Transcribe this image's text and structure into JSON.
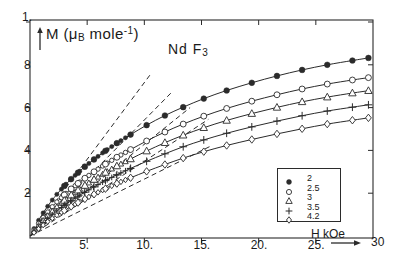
{
  "chart_data": {
    "type": "line",
    "title": "Nd F3",
    "title_display": "Nd F",
    "title_sub": "3",
    "xlabel": "H kOe",
    "ylabel": "M (μ_B mole^-1)",
    "ylabel_main": "M (",
    "ylabel_sub": "B",
    "ylabel_mid": " mole",
    "ylabel_sup": "-1",
    "ylabel_end": ")",
    "ylabel_mu": "μ",
    "xlim": [
      0,
      30
    ],
    "ylim": [
      0,
      1.0
    ],
    "xticks": [
      "5.",
      "10.",
      "15.",
      "20.",
      "25.",
      "30"
    ],
    "xtick_values": [
      5,
      10,
      15,
      20,
      25,
      30
    ],
    "yticks": [
      "1.",
      "8",
      "6",
      "4",
      "2"
    ],
    "ytick_values": [
      1.0,
      0.8,
      0.6,
      0.4,
      0.2
    ],
    "grid": false,
    "legend_position": "lower-right",
    "legend_title": "",
    "series": [
      {
        "name": "2",
        "label": "2",
        "marker": "filled-circle",
        "x": [
          0.6,
          1.2,
          1.8,
          2.4,
          3.0,
          3.6,
          4.2,
          4.8,
          5.6,
          6.6,
          7.6,
          8.8,
          10.2,
          11.8,
          13.4,
          15.2,
          17.2,
          19.4,
          21.6,
          23.8,
          26.0,
          28.2,
          29.6
        ],
        "y": [
          0.06,
          0.112,
          0.158,
          0.198,
          0.234,
          0.266,
          0.296,
          0.324,
          0.358,
          0.398,
          0.434,
          0.474,
          0.518,
          0.563,
          0.602,
          0.642,
          0.68,
          0.716,
          0.748,
          0.776,
          0.8,
          0.82,
          0.832
        ]
      },
      {
        "name": "2.5",
        "label": "2.5",
        "marker": "open-circle",
        "x": [
          0.6,
          1.2,
          1.8,
          2.4,
          3.0,
          3.6,
          4.2,
          4.8,
          5.6,
          6.6,
          7.6,
          8.8,
          10.2,
          11.8,
          13.4,
          15.2,
          17.2,
          19.4,
          21.6,
          23.8,
          26.0,
          28.2,
          29.6
        ],
        "y": [
          0.048,
          0.09,
          0.128,
          0.162,
          0.192,
          0.22,
          0.246,
          0.27,
          0.3,
          0.336,
          0.368,
          0.404,
          0.444,
          0.486,
          0.523,
          0.56,
          0.596,
          0.63,
          0.66,
          0.687,
          0.71,
          0.729,
          0.74
        ]
      },
      {
        "name": "3",
        "label": "3",
        "marker": "triangle",
        "x": [
          0.6,
          1.2,
          1.8,
          2.4,
          3.0,
          3.6,
          4.2,
          4.8,
          5.6,
          6.6,
          7.6,
          8.8,
          10.2,
          11.8,
          13.4,
          15.2,
          17.2,
          19.4,
          21.6,
          23.8,
          26.0,
          28.2,
          29.6
        ],
        "y": [
          0.04,
          0.076,
          0.109,
          0.139,
          0.166,
          0.191,
          0.214,
          0.236,
          0.264,
          0.297,
          0.327,
          0.36,
          0.397,
          0.436,
          0.471,
          0.506,
          0.54,
          0.572,
          0.601,
          0.627,
          0.649,
          0.668,
          0.679
        ]
      },
      {
        "name": "3.5",
        "label": "3.5",
        "marker": "plus",
        "x": [
          0.6,
          1.2,
          1.8,
          2.4,
          3.0,
          3.6,
          4.2,
          4.8,
          5.6,
          6.6,
          7.6,
          8.8,
          10.2,
          11.8,
          13.4,
          15.2,
          17.2,
          19.4,
          21.6,
          23.8,
          26.0,
          28.2,
          29.6
        ],
        "y": [
          0.034,
          0.065,
          0.093,
          0.119,
          0.143,
          0.165,
          0.186,
          0.205,
          0.23,
          0.259,
          0.286,
          0.316,
          0.349,
          0.384,
          0.417,
          0.449,
          0.48,
          0.51,
          0.537,
          0.562,
          0.584,
          0.602,
          0.613
        ]
      },
      {
        "name": "4.2",
        "label": "4.2",
        "marker": "diamond",
        "x": [
          0.6,
          1.2,
          1.8,
          2.4,
          3.0,
          3.6,
          4.2,
          4.8,
          5.6,
          6.6,
          7.6,
          8.8,
          10.2,
          11.8,
          13.4,
          15.2,
          17.2,
          19.4,
          21.6,
          23.8,
          26.0,
          28.2,
          29.6
        ],
        "y": [
          0.027,
          0.053,
          0.077,
          0.099,
          0.119,
          0.138,
          0.156,
          0.173,
          0.195,
          0.221,
          0.245,
          0.272,
          0.302,
          0.334,
          0.364,
          0.394,
          0.423,
          0.451,
          0.477,
          0.501,
          0.523,
          0.541,
          0.552
        ]
      }
    ],
    "tangents": [
      {
        "series": "2",
        "x0": 0.0,
        "y0": 0.0,
        "x1": 10.6,
        "y1": 0.76
      },
      {
        "series": "2.5",
        "x0": 0.0,
        "y0": 0.0,
        "x1": 12.4,
        "y1": 0.672
      },
      {
        "series": "3",
        "x0": 0.0,
        "y0": 0.0,
        "x1": 14.0,
        "y1": 0.6
      },
      {
        "series": "3.5",
        "x0": 0.0,
        "y0": 0.0,
        "x1": 15.6,
        "y1": 0.545
      },
      {
        "series": "4.2",
        "x0": 0.0,
        "y0": 0.0,
        "x1": 15.8,
        "y1": 0.42
      }
    ]
  }
}
